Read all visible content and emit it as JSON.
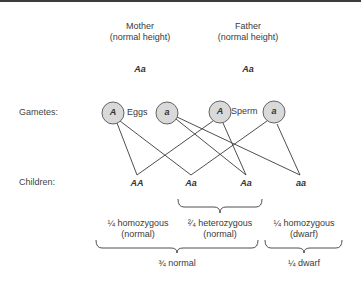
{
  "parents": {
    "mother": {
      "title": "Mother",
      "phenotype": "(normal height)",
      "genotype": "Aa"
    },
    "father": {
      "title": "Father",
      "phenotype": "(normal height)",
      "genotype": "Aa"
    }
  },
  "rows": {
    "gametes": "Gametes:",
    "children": "Children:"
  },
  "gametes": {
    "eggs_label": "Eggs",
    "sperm_label": "Sperm",
    "egg_alleles": [
      "A",
      "a"
    ],
    "sperm_alleles": [
      "A",
      "a"
    ]
  },
  "children": [
    "AA",
    "Aa",
    "Aa",
    "aa"
  ],
  "groups": {
    "homozygous_normal": {
      "line1": "¼ homozygous",
      "line2": "(normal)"
    },
    "heterozygous": {
      "line1": "²⁄₄ heterozygous",
      "line2": "(normal)"
    },
    "homozygous_dwarf": {
      "line1": "¼ homozygous",
      "line2": "(dwarf)"
    }
  },
  "totals": {
    "normal": "¾ normal",
    "dwarf": "¼ dwarf"
  },
  "colors": {
    "circle_fill": "#d9d9d9",
    "circle_stroke": "#555555",
    "line": "#3a3a3a"
  }
}
